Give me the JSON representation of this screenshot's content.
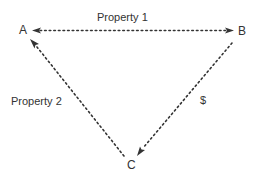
{
  "diagram": {
    "type": "triangle-relationship",
    "nodes": [
      {
        "id": "A",
        "label": "A"
      },
      {
        "id": "B",
        "label": "B"
      },
      {
        "id": "C",
        "label": "C"
      }
    ],
    "edges": [
      {
        "from": "A",
        "to": "B",
        "label": "Property 1",
        "style": "dotted",
        "arrows": "both"
      },
      {
        "from": "C",
        "to": "A",
        "label": "Property 2",
        "style": "dotted",
        "arrows": "to-A"
      },
      {
        "from": "B",
        "to": "C",
        "label": "$",
        "style": "dotted",
        "arrows": "to-C"
      }
    ],
    "colors": {
      "line": "#333333",
      "text": "#333333",
      "background": "#ffffff"
    }
  }
}
